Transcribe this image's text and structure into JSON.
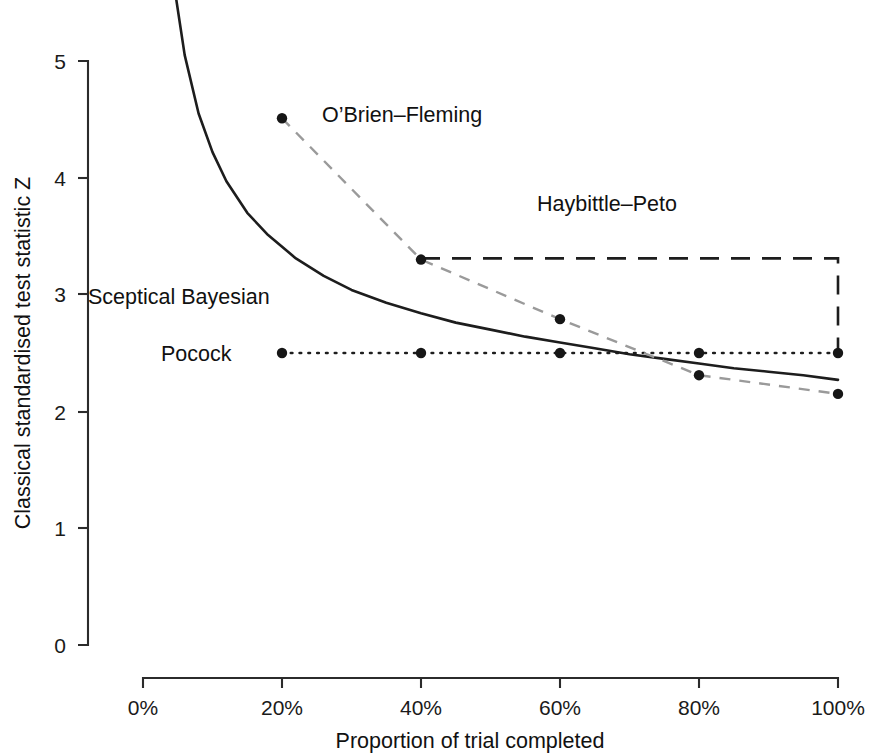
{
  "chart_data": {
    "type": "line",
    "title": "",
    "xlabel": "Proportion of trial completed",
    "ylabel": "Classical standardised test statistic Z",
    "xlim": [
      0,
      100
    ],
    "ylim": [
      0,
      5
    ],
    "xtick_labels": [
      "0%",
      "20%",
      "40%",
      "60%",
      "80%",
      "100%"
    ],
    "xtick_values": [
      0,
      20,
      40,
      60,
      80,
      100
    ],
    "ytick_labels": [
      "0",
      "1",
      "2",
      "3",
      "4",
      "5"
    ],
    "ytick_values": [
      0,
      1,
      2,
      3,
      4,
      5
    ],
    "grid": false,
    "legend_position": "inline-annotations",
    "series": [
      {
        "name": "O'Brien-Fleming",
        "label": "O’Brien–Fleming",
        "style": "dashed",
        "color": "#9a9a9a",
        "markers": true,
        "x": [
          20,
          40,
          60,
          80,
          100
        ],
        "values": [
          4.51,
          3.3,
          2.79,
          2.31,
          2.15
        ]
      },
      {
        "name": "Haybittle-Peto",
        "label": "Haybittle–Peto",
        "style": "long-dashed",
        "color": "#1d1d1d",
        "markers": false,
        "x": [
          40,
          100,
          100
        ],
        "values": [
          3.31,
          3.31,
          2.5
        ]
      },
      {
        "name": "Pocock",
        "label": "Pocock",
        "style": "dotted",
        "color": "#1d1d1d",
        "markers": true,
        "x": [
          20,
          40,
          60,
          80,
          100
        ],
        "values": [
          2.5,
          2.5,
          2.5,
          2.5,
          2.5
        ]
      },
      {
        "name": "Sceptical Bayesian",
        "label": "Sceptical Bayesian",
        "style": "solid",
        "color": "#1d1d1d",
        "markers": false,
        "x": [
          4.6,
          6,
          8,
          10,
          12,
          15,
          18,
          22,
          26,
          30,
          35,
          40,
          45,
          50,
          55,
          60,
          65,
          70,
          75,
          80,
          85,
          90,
          95,
          100
        ],
        "values": [
          5.6,
          5.05,
          4.55,
          4.22,
          3.97,
          3.7,
          3.51,
          3.31,
          3.16,
          3.04,
          2.93,
          2.84,
          2.76,
          2.7,
          2.64,
          2.59,
          2.54,
          2.49,
          2.45,
          2.41,
          2.37,
          2.34,
          2.31,
          2.27
        ]
      }
    ],
    "annotations": [
      {
        "text": "O’Brien–Fleming",
        "x": 100,
        "y": 122,
        "anchor": "start"
      },
      {
        "text": "Haybittle–Peto",
        "x": 607,
        "y": 211,
        "anchor": "middle"
      },
      {
        "text": "Sceptical Bayesian",
        "x": 88,
        "y": 304,
        "anchor": "start"
      },
      {
        "text": "Pocock",
        "x": 161,
        "y": 360,
        "anchor": "start"
      }
    ]
  },
  "axes": {
    "x_title": "Proportion of trial completed",
    "y_title": "Classical standardised test statistic Z"
  }
}
